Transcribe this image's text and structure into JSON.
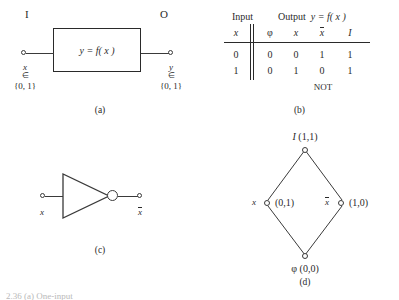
{
  "figure": {
    "panel_a": {
      "caption": "(a)",
      "input_port_label": "I",
      "output_port_label": "O",
      "box_expression": "y = f( x )",
      "input_var": "x",
      "input_member_symbol": "∈",
      "input_domain": "{0, 1}",
      "output_var": "y",
      "output_member_symbol": "∈",
      "output_domain": "{0, 1}"
    },
    "panel_b": {
      "caption": "(b)",
      "group_headers": {
        "input": "Input",
        "output": "Output  y = f( x )"
      },
      "column_headers": [
        "x",
        "φ",
        "x",
        "x̄",
        "I"
      ],
      "rows": [
        {
          "input": "0",
          "outputs": [
            "0",
            "0",
            "1",
            "1"
          ]
        },
        {
          "input": "1",
          "outputs": [
            "0",
            "1",
            "0",
            "1"
          ]
        }
      ],
      "function_note": "NOT",
      "function_note_column": 3
    },
    "panel_c": {
      "caption": "(c)",
      "gate_type": "NOT gate (inverter)",
      "input_label": "x",
      "output_label": "x̄"
    },
    "panel_d": {
      "caption": "(d)",
      "diagram_type": "Hasse lattice",
      "nodes": [
        {
          "id": "top",
          "symbol": "I",
          "coords": "(1,1)",
          "label": "I (1,1)"
        },
        {
          "id": "left",
          "symbol": "x",
          "coords": "(0,1)",
          "label": "(0,1)"
        },
        {
          "id": "right",
          "symbol": "x̄",
          "coords": "(1,0)",
          "label": "(1,0)"
        },
        {
          "id": "bottom",
          "symbol": "φ",
          "coords": "(0,0)",
          "label": "φ (0,0)"
        }
      ],
      "edges": [
        [
          "top",
          "left"
        ],
        [
          "top",
          "right"
        ],
        [
          "left",
          "bottom"
        ],
        [
          "right",
          "bottom"
        ]
      ]
    },
    "bottom_caption_partial": "2.36  (a) One-input"
  },
  "colors": {
    "ink": "#2a2a2a",
    "line": "#3a3a3a",
    "paper": "#ffffff"
  }
}
